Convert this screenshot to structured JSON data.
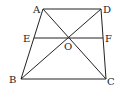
{
  "diagram": {
    "points": {
      "A": {
        "label": "A",
        "x": 43,
        "y": 9
      },
      "D": {
        "label": "D",
        "x": 101,
        "y": 9
      },
      "B": {
        "label": "B",
        "x": 21,
        "y": 79
      },
      "C": {
        "label": "C",
        "x": 106,
        "y": 79
      },
      "E": {
        "label": "E",
        "x": 34,
        "y": 38
      },
      "F": {
        "label": "F",
        "x": 103,
        "y": 38
      },
      "O": {
        "label": "O",
        "x": 68,
        "y": 38
      }
    },
    "segments": [
      "AD",
      "BC",
      "AB",
      "DC",
      "AC",
      "BD",
      "EF"
    ],
    "line_color": "#222222"
  }
}
